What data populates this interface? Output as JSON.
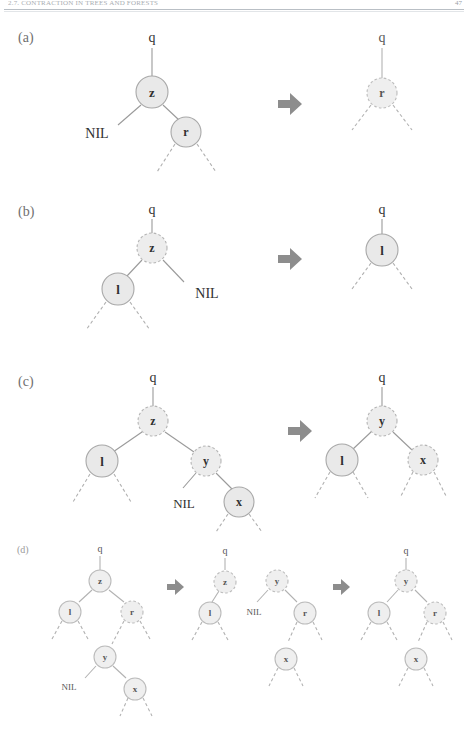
{
  "header": {
    "running_title": "2.7. CONTRACTION IN TREES AND FORESTS",
    "page_number": "47"
  },
  "figure": {
    "panels": [
      {
        "id": "a",
        "label": "(a)",
        "before": {
          "parent_label": "q",
          "nodes": [
            {
              "name": "z",
              "style": "solid"
            },
            {
              "name": "r",
              "style": "solid"
            }
          ],
          "nil_label": "NIL"
        },
        "arrow": "right-arrow-icon",
        "after": {
          "parent_label": "q",
          "nodes": [
            {
              "name": "r",
              "style": "dashed"
            }
          ]
        }
      },
      {
        "id": "b",
        "label": "(b)",
        "before": {
          "parent_label": "q",
          "nodes": [
            {
              "name": "z",
              "style": "dashed"
            },
            {
              "name": "l",
              "style": "solid"
            }
          ],
          "nil_label": "NIL"
        },
        "arrow": "right-arrow-icon",
        "after": {
          "parent_label": "q",
          "nodes": [
            {
              "name": "l",
              "style": "solid"
            }
          ]
        }
      },
      {
        "id": "c",
        "label": "(c)",
        "before": {
          "parent_label": "q",
          "nodes": [
            {
              "name": "z",
              "style": "dashed"
            },
            {
              "name": "l",
              "style": "solid"
            },
            {
              "name": "y",
              "style": "dashed"
            },
            {
              "name": "x",
              "style": "solid"
            }
          ],
          "nil_label": "NIL"
        },
        "arrow": "right-arrow-icon",
        "after": {
          "parent_label": "q",
          "nodes": [
            {
              "name": "y",
              "style": "dashed"
            },
            {
              "name": "l",
              "style": "solid"
            },
            {
              "name": "x",
              "style": "dashed"
            }
          ]
        }
      },
      {
        "id": "d",
        "label": "(d)",
        "step1": {
          "parent_label": "q",
          "nodes": [
            {
              "name": "z",
              "style": "solid"
            },
            {
              "name": "l",
              "style": "solid"
            },
            {
              "name": "r",
              "style": "dashed"
            },
            {
              "name": "y",
              "style": "solid"
            },
            {
              "name": "x",
              "style": "solid"
            }
          ],
          "nil_label": "NIL"
        },
        "arrow1": "right-arrow-icon",
        "step2": {
          "parent_label": "q",
          "nodes": [
            {
              "name": "z",
              "style": "dashed"
            },
            {
              "name": "l",
              "style": "solid"
            },
            {
              "name": "y",
              "style": "dashed"
            },
            {
              "name": "r",
              "style": "solid"
            },
            {
              "name": "x",
              "style": "solid"
            }
          ],
          "nil_label": "NIL"
        },
        "arrow2": "right-arrow-icon",
        "step3": {
          "parent_label": "q",
          "nodes": [
            {
              "name": "y",
              "style": "dashed"
            },
            {
              "name": "l",
              "style": "solid"
            },
            {
              "name": "r",
              "style": "dashed"
            },
            {
              "name": "x",
              "style": "solid"
            }
          ]
        }
      }
    ]
  },
  "colors": {
    "node_fill": "#e9e9e9",
    "node_stroke": "#a8a8a8",
    "edge": "#9a9a9a",
    "arrow": "#8d8d8d",
    "text": "#303030",
    "label": "#6f6f6f",
    "rule": "#b9bfc5"
  }
}
